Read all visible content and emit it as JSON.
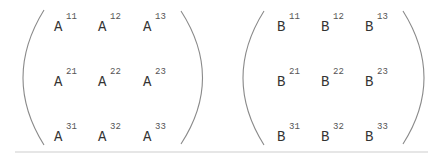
{
  "matrices": [
    {
      "name": "A",
      "entries": [
        [
          {
            "base": "A",
            "sup": "11"
          },
          {
            "base": "A",
            "sup": "12"
          },
          {
            "base": "A",
            "sup": "13"
          }
        ],
        [
          {
            "base": "A",
            "sup": "21"
          },
          {
            "base": "A",
            "sup": "22"
          },
          {
            "base": "A",
            "sup": "23"
          }
        ],
        [
          {
            "base": "A",
            "sup": "31"
          },
          {
            "base": "A",
            "sup": "32"
          },
          {
            "base": "A",
            "sup": "33"
          }
        ]
      ]
    },
    {
      "name": "B",
      "entries": [
        [
          {
            "base": "B",
            "sup": "11"
          },
          {
            "base": "B",
            "sup": "12"
          },
          {
            "base": "B",
            "sup": "13"
          }
        ],
        [
          {
            "base": "B",
            "sup": "21"
          },
          {
            "base": "B",
            "sup": "22"
          },
          {
            "base": "B",
            "sup": "23"
          }
        ],
        [
          {
            "base": "B",
            "sup": "31"
          },
          {
            "base": "B",
            "sup": "32"
          },
          {
            "base": "B",
            "sup": "33"
          }
        ]
      ]
    }
  ]
}
